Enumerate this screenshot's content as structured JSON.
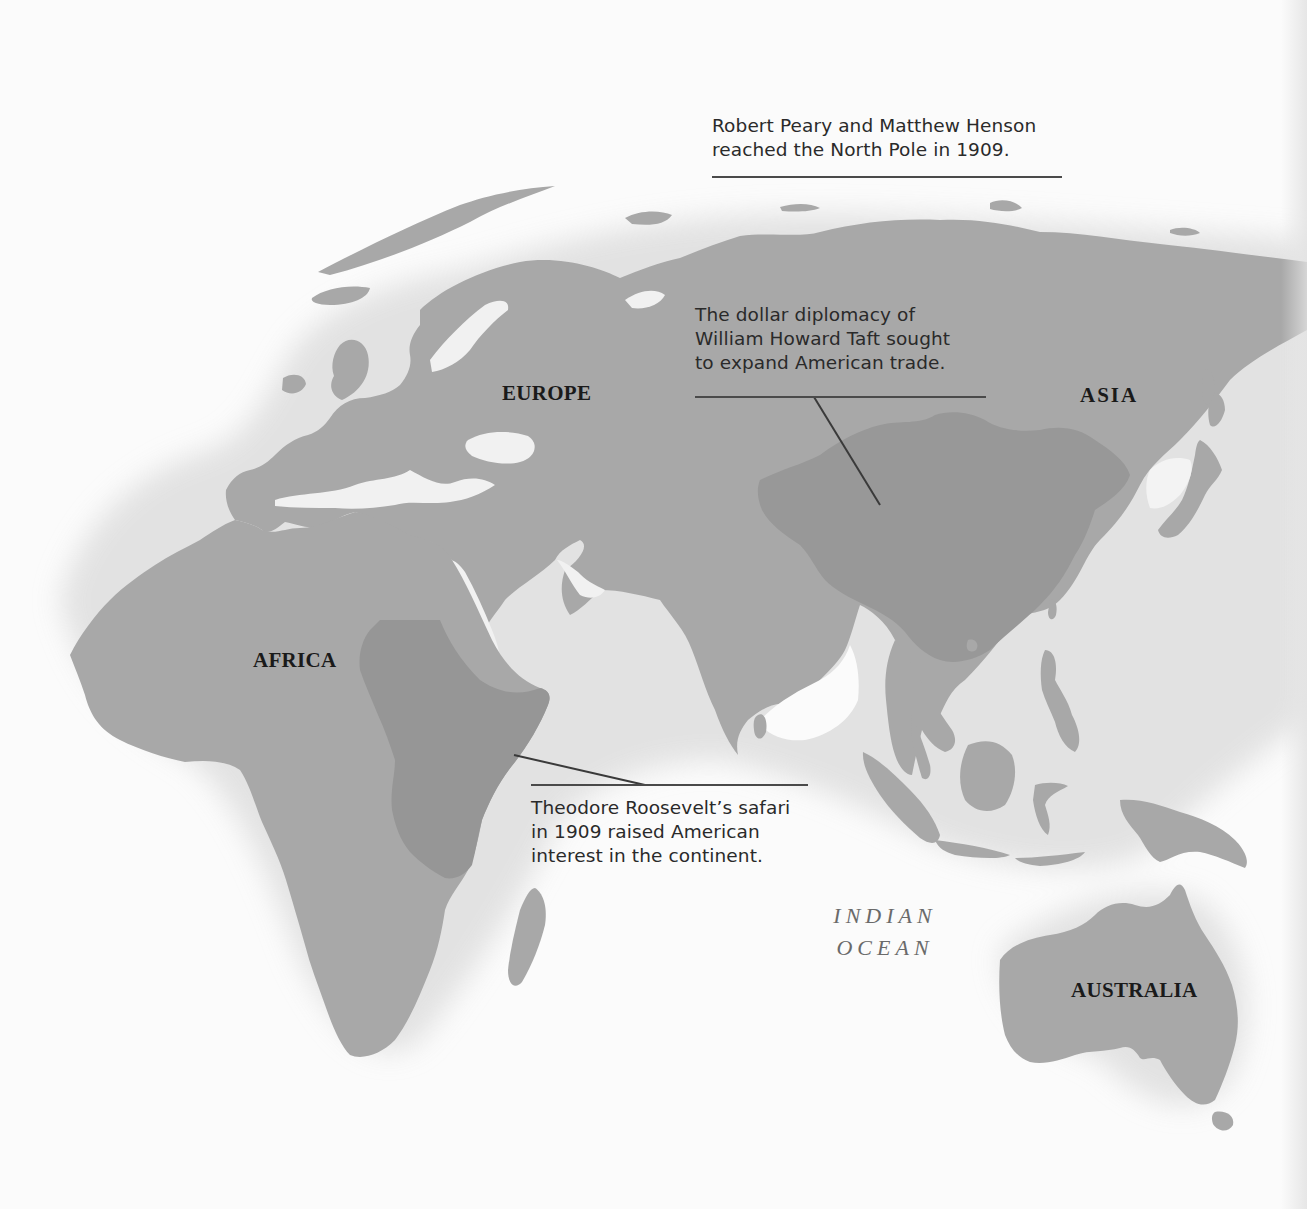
{
  "map": {
    "colors": {
      "ocean": "#fbfbfb",
      "land": "#a8a8a8",
      "highlight": "#969696",
      "text": "#2a2a2a",
      "rule": "#4a4a4a",
      "ocean_label": "#6a6a6a"
    },
    "regions": {
      "europe": "EUROPE",
      "asia": "ASIA",
      "africa": "AFRICA",
      "australia": "AUSTRALIA"
    },
    "ocean": {
      "line1": "INDIAN",
      "line2": "OCEAN"
    },
    "annotations": {
      "north_pole": {
        "line1": "Robert Peary and Matthew Henson",
        "line2": "reached the North Pole in 1909."
      },
      "taft": {
        "line1": "The dollar diplomacy of",
        "line2": "William Howard Taft sought",
        "line3": "to expand American trade."
      },
      "roosevelt": {
        "line1": "Theodore Roosevelt’s safari",
        "line2": "in 1909 raised American",
        "line3": "interest in the continent."
      }
    },
    "highlighted_areas": [
      "China",
      "East Africa"
    ]
  }
}
